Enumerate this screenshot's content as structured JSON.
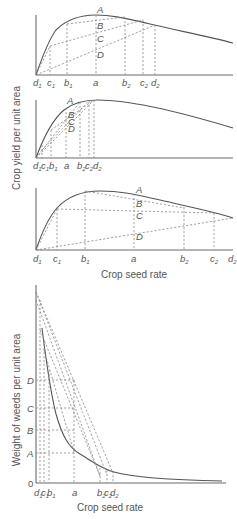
{
  "figure": {
    "top_panel_ylabel": "Crop yield per unit area",
    "bottom_panel_ylabel": "Weight of weeds per unit area",
    "xlabel_upper": "Crop seed rate",
    "xlabel_lower": "Crop seed rate"
  },
  "graph1": {
    "point_labels": [
      "A",
      "B",
      "C",
      "D"
    ],
    "x_ticks": [
      {
        "base": "d",
        "sub": "1"
      },
      {
        "base": "c",
        "sub": "1"
      },
      {
        "base": "b",
        "sub": "1"
      },
      {
        "base": "a",
        "sub": ""
      },
      {
        "base": "b",
        "sub": "2"
      },
      {
        "base": "c",
        "sub": "2"
      },
      {
        "base": "d",
        "sub": "2"
      }
    ]
  },
  "graph2": {
    "point_labels": [
      "A",
      "B",
      "C",
      "D"
    ],
    "x_ticks": [
      {
        "base": "d",
        "sub": "1"
      },
      {
        "base": "c",
        "sub": "1"
      },
      {
        "base": "b",
        "sub": "1"
      },
      {
        "base": "a",
        "sub": ""
      },
      {
        "base": "b",
        "sub": "2"
      },
      {
        "base": "c",
        "sub": "2"
      },
      {
        "base": "d",
        "sub": "2"
      }
    ]
  },
  "graph3": {
    "point_labels": [
      "A",
      "B",
      "C",
      "D"
    ],
    "x_ticks": [
      {
        "base": "d",
        "sub": "1"
      },
      {
        "base": "c",
        "sub": "1"
      },
      {
        "base": "b",
        "sub": "1"
      },
      {
        "base": "a",
        "sub": ""
      },
      {
        "base": "b",
        "sub": "2"
      },
      {
        "base": "c",
        "sub": "2"
      },
      {
        "base": "d",
        "sub": "2"
      }
    ]
  },
  "graph4": {
    "y_ticks": [
      "D",
      "C",
      "B",
      "A",
      "0"
    ],
    "x_ticks": [
      {
        "base": "d",
        "sub": "1"
      },
      {
        "base": "c",
        "sub": "1"
      },
      {
        "base": "b",
        "sub": "1"
      },
      {
        "base": "a",
        "sub": ""
      },
      {
        "base": "b",
        "sub": "2"
      },
      {
        "base": "c",
        "sub": "2"
      },
      {
        "base": "d",
        "sub": "2"
      }
    ]
  }
}
